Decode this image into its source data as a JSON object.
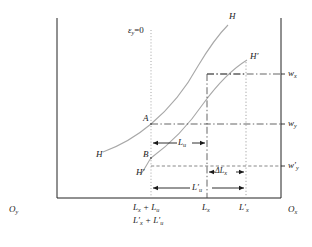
{
  "figure": {
    "type": "diagram",
    "axes": {
      "origin_left_label": "O",
      "origin_left_sub": "y",
      "origin_right_label": "O",
      "origin_right_sub": "x"
    },
    "curves": [
      {
        "name": "curve-H-left-tail",
        "label": "H",
        "sub": ""
      },
      {
        "name": "curve-H-top",
        "label": "H",
        "sub": ""
      },
      {
        "name": "curve-Hprime-bottom",
        "label": "H′",
        "sub": ""
      },
      {
        "name": "curve-Hprime-top",
        "label": "H′",
        "sub": ""
      }
    ],
    "points": [
      {
        "name": "point-A",
        "label": "A"
      },
      {
        "name": "point-B",
        "label": "B"
      }
    ],
    "annotations": {
      "epsilon_line": {
        "base": "ε",
        "sub": "y",
        "rest": "=0"
      },
      "lu_arrow": {
        "base": "L",
        "sub": "u"
      },
      "delta_lx_arrow": {
        "base": "ΔL",
        "sub": "x"
      },
      "lu_prime_arrow": {
        "base": "L′",
        "sub": "u"
      }
    },
    "wage_labels": [
      {
        "name": "wage-wx",
        "base": "w",
        "sub": "x"
      },
      {
        "name": "wage-wy",
        "base": "w",
        "sub": "y"
      },
      {
        "name": "wage-wy-prime",
        "base": "w′",
        "sub": "y"
      }
    ],
    "x_tick_labels": [
      {
        "name": "tick-lx-plus-lu",
        "line1": "L",
        "line1_sub": "x",
        "line1_rest": " + L",
        "line1_sub2": "u"
      },
      {
        "name": "tick-lx-prime-plus-lu-prime",
        "line2": "L′",
        "line2_sub": "x",
        "line2_rest": " + L′",
        "line2_sub2": "u"
      },
      {
        "name": "tick-lx",
        "base": "L",
        "sub": "x"
      },
      {
        "name": "tick-lx-prime",
        "base": "L′",
        "sub": "x"
      }
    ],
    "colors": {
      "axis": "#222222",
      "curve": "#9a9a9a",
      "dashdot": "#4a4a4a",
      "dotted": "#8a8a8a",
      "text": "#1a1a1a"
    }
  }
}
